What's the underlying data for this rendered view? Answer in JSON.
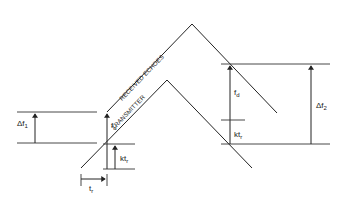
{
  "diagram": {
    "type": "FMCW radar triangular frequency modulation timing diagram",
    "curves": [
      {
        "name": "received-echoes",
        "label": "RECEIVED ECHOES",
        "points": [
          [
            107,
            112
          ],
          [
            192,
            24
          ],
          [
            277,
            113
          ]
        ]
      },
      {
        "name": "transmitter",
        "label": "TRANSMITTER",
        "points": [
          [
            81,
            168
          ],
          [
            167,
            80
          ],
          [
            252,
            168
          ]
        ]
      }
    ],
    "labels": {
      "delta_f1": "Δf",
      "delta_f1_sub": "1",
      "delta_f2": "Δf",
      "delta_f2_sub": "2",
      "fd_left": "f",
      "fd_left_sub": "d",
      "fd_right": "f",
      "fd_right_sub": "d",
      "ktr_left": "kt",
      "ktr_left_sub": "r",
      "ktr_right": "kt",
      "ktr_right_sub": "r",
      "tr": "t",
      "tr_sub": "r",
      "received_echoes": "RECEIVED ECHOES",
      "transmitter": "TRANSMITTER"
    }
  }
}
